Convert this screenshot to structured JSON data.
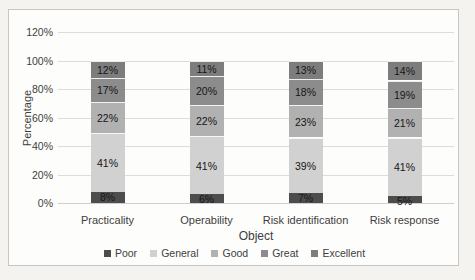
{
  "chart_data": {
    "type": "bar",
    "stacked": true,
    "title": "",
    "xlabel": "Object",
    "ylabel": "Percentage",
    "ylim": [
      0,
      120
    ],
    "ytick_step": 20,
    "ytick_labels": [
      "0%",
      "20%",
      "40%",
      "60%",
      "80%",
      "100%",
      "120%"
    ],
    "grid": true,
    "legend_position": "bottom",
    "data_label_suffix": "%",
    "categories": [
      "Practicality",
      "Operability",
      "Risk identification",
      "Risk response"
    ],
    "series": [
      {
        "name": "Poor",
        "color": "#4d4d4d",
        "values": [
          8,
          6,
          7,
          5
        ]
      },
      {
        "name": "General",
        "color": "#d1d1d1",
        "values": [
          41,
          41,
          39,
          41
        ]
      },
      {
        "name": "Good",
        "color": "#b1b1b1",
        "values": [
          22,
          22,
          23,
          21
        ]
      },
      {
        "name": "Great",
        "color": "#8c8c8c",
        "values": [
          17,
          20,
          18,
          19
        ]
      },
      {
        "name": "Excellent",
        "color": "#7d7d7d",
        "values": [
          12,
          11,
          13,
          14
        ]
      }
    ]
  },
  "frame": {
    "border_color": "#c6c6c6",
    "background": "#fdfdfc",
    "page_background": "#f4f3ef",
    "gridline_color": "#dcdcdc"
  }
}
